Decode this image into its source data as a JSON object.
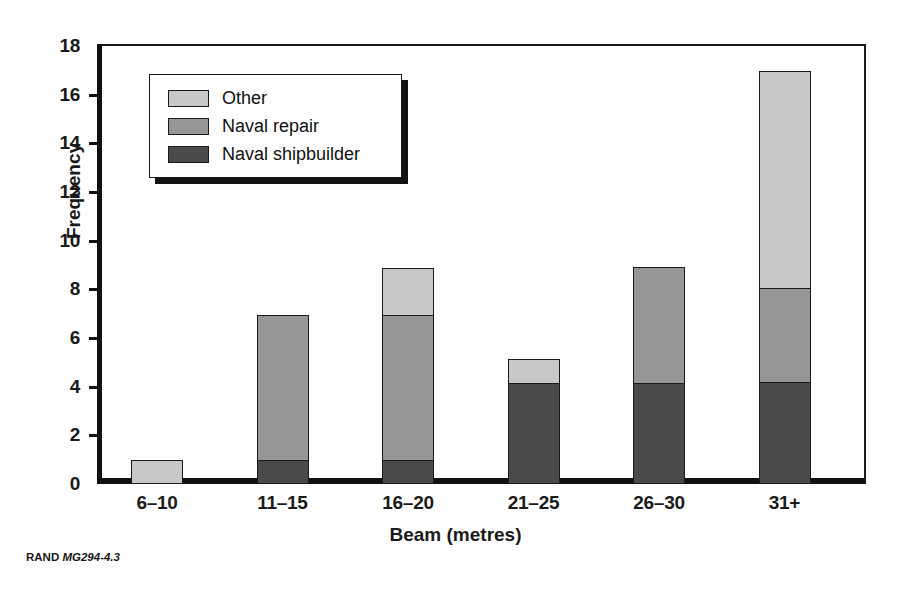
{
  "caption": {
    "publisher": "RAND",
    "figure_id": "MG294-4.3"
  },
  "legend": {
    "position": "upper-left-inside",
    "items": [
      {
        "label": "Other",
        "color": "#c8c8c8"
      },
      {
        "label": "Naval repair",
        "color": "#969696"
      },
      {
        "label": "Naval shipbuilder",
        "color": "#4a4a4a"
      }
    ]
  },
  "chart_data": {
    "type": "bar",
    "stacked": true,
    "title": "",
    "subtitle": "",
    "xlabel": "Beam (metres)",
    "ylabel": "Frequency",
    "categories": [
      "6–10",
      "11–15",
      "16–20",
      "21–25",
      "26–30",
      "31+"
    ],
    "series": [
      {
        "name": "Naval shipbuilder",
        "color": "#4a4a4a",
        "values": [
          0,
          1,
          1,
          4.15,
          4.15,
          4.2
        ]
      },
      {
        "name": "Naval repair",
        "color": "#969696",
        "values": [
          0,
          6,
          6,
          0,
          4.85,
          3.9
        ]
      },
      {
        "name": "Other",
        "color": "#c8c8c8",
        "values": [
          1,
          0,
          2,
          1.05,
          0,
          9.0
        ]
      }
    ],
    "totals": [
      1,
      7,
      9,
      5.2,
      9,
      17.1
    ],
    "ylim": [
      0,
      18
    ],
    "yticks": [
      0,
      2,
      4,
      6,
      8,
      10,
      12,
      14,
      16,
      18
    ],
    "ytick_labels": [
      "0",
      "2",
      "4",
      "6",
      "8",
      "10",
      "12",
      "14",
      "16",
      "18"
    ],
    "grid": false,
    "legend_position": "upper left"
  }
}
